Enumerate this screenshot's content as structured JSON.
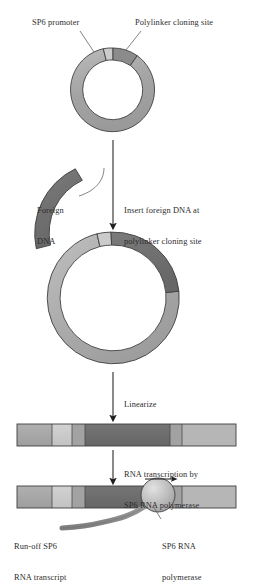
{
  "figure": {
    "type": "molecular-biology-process-diagram"
  },
  "labels": {
    "sp6_promoter": "SP6 promoter",
    "polylinker": "Polylinker cloning site",
    "foreign_dna_line1": "Foreign",
    "foreign_dna_line2": "DNA",
    "insert_line1": "Insert foreign DNA at",
    "insert_line2": "polylinker cloning site",
    "linearize": "Linearize",
    "transcription_line1": "RNA transcription by",
    "transcription_line2": "SP6 RNA polymerase",
    "runoff_line1": "Run-off SP6",
    "runoff_line2": "RNA transcript",
    "polymerase_line1": "SP6 RNA",
    "polymerase_line2": "polymerase"
  },
  "colors": {
    "vector_gray": "#a6a6a6",
    "vector_gray_light": "#b4b4b4",
    "promoter_light": "#c9c9c9",
    "polylinker_dark": "#8a8a8a",
    "foreign_dna_dark": "#6e6e6e",
    "transcript_gray": "#8d8d8d",
    "outline": "#3a3a3a",
    "text": "#2d2d2d",
    "background": "#ffffff",
    "sphere_light": "#d8d8d8",
    "sphere_mid": "#a9a9a9"
  },
  "stages": [
    {
      "name": "plasmid-vector",
      "shape": "circle",
      "center": [
        113,
        90
      ],
      "outer_radius": 42,
      "inner_radius": 30,
      "segments": [
        {
          "name": "vector-backbone",
          "color": "#a6a6a6",
          "start_deg": -55,
          "end_deg": 290
        },
        {
          "name": "sp6-promoter",
          "color": "#c9c9c9",
          "start_deg": -78,
          "end_deg": -55
        },
        {
          "name": "polylinker-cloning-site",
          "color": "#8a8a8a",
          "start_deg": -104,
          "end_deg": -78
        }
      ]
    },
    {
      "name": "foreign-dna-arc",
      "shape": "arc",
      "color": "#6e6e6e",
      "center": [
        108,
        232
      ],
      "outer_radius": 72,
      "inner_radius": 58,
      "start_deg": 183,
      "end_deg": 243
    },
    {
      "name": "recombinant-plasmid",
      "shape": "circle",
      "center": [
        113,
        298
      ],
      "outer_radius": 66,
      "inner_radius": 53,
      "segments": [
        {
          "name": "vector-backbone",
          "color": "#a6a6a6",
          "start_deg": -60,
          "end_deg": 256
        },
        {
          "name": "sp6-promoter",
          "color": "#c9c9c9",
          "start_deg": -104,
          "end_deg": -82
        },
        {
          "name": "inserted-foreign-dna",
          "color": "#6e6e6e",
          "start_deg": -82,
          "end_deg": -5
        }
      ]
    },
    {
      "name": "linearized-dna",
      "shape": "bar",
      "x": 17,
      "y": 424,
      "width": 219,
      "height": 22,
      "segments": [
        {
          "name": "vector-left",
          "color": "#a6a6a6",
          "x": 17,
          "width": 35
        },
        {
          "name": "sp6-promoter",
          "color": "#c9c9c9",
          "x": 52,
          "width": 20
        },
        {
          "name": "polylinker-left",
          "color": "#a0a0a0",
          "x": 72,
          "width": 13
        },
        {
          "name": "foreign-dna",
          "color": "#6e6e6e",
          "x": 85,
          "width": 85
        },
        {
          "name": "polylinker-right",
          "color": "#a0a0a0",
          "x": 170,
          "width": 12
        },
        {
          "name": "vector-right",
          "color": "#b4b4b4",
          "x": 182,
          "width": 54
        }
      ]
    },
    {
      "name": "transcribing-dna",
      "shape": "bar",
      "x": 17,
      "y": 486,
      "width": 219,
      "height": 22,
      "segments": [
        {
          "name": "vector-left",
          "color": "#a6a6a6",
          "x": 17,
          "width": 35
        },
        {
          "name": "sp6-promoter",
          "color": "#c9c9c9",
          "x": 52,
          "width": 20
        },
        {
          "name": "polylinker-left",
          "color": "#a0a0a0",
          "x": 72,
          "width": 13
        },
        {
          "name": "foreign-dna",
          "color": "#6e6e6e",
          "x": 85,
          "width": 85
        },
        {
          "name": "polylinker-right",
          "color": "#a0a0a0",
          "x": 170,
          "width": 12
        },
        {
          "name": "vector-right",
          "color": "#b4b4b4",
          "x": 182,
          "width": 54
        }
      ],
      "polymerase": {
        "center": [
          158,
          495
        ],
        "radius": 17
      },
      "direction_arrow": {
        "from": [
          147,
          480
        ],
        "to": [
          177,
          480
        ],
        "points": "right"
      }
    }
  ],
  "arrows": [
    {
      "name": "insert-step-arrow",
      "from": [
        113,
        140
      ],
      "to": [
        113,
        228
      ]
    },
    {
      "name": "linearize-step-arrow",
      "from": [
        113,
        372
      ],
      "to": [
        113,
        420
      ]
    },
    {
      "name": "transcription-step-arrow",
      "from": [
        113,
        448
      ],
      "to": [
        113,
        482
      ]
    }
  ],
  "leaders": [
    {
      "name": "sp6-promoter-leader",
      "from": [
        80,
        30
      ],
      "to": [
        94,
        52
      ]
    },
    {
      "name": "polylinker-leader",
      "from": [
        140,
        30
      ],
      "to": [
        125,
        50
      ]
    },
    {
      "name": "foreign-dna-leader",
      "from": [
        78,
        190
      ],
      "to": [
        104,
        172
      ]
    },
    {
      "name": "polymerase-leader",
      "from": [
        160,
        520
      ],
      "to": [
        152,
        505
      ]
    }
  ]
}
